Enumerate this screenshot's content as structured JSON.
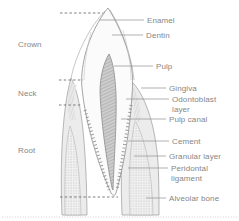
{
  "diagram": {
    "region_labels": {
      "crown": "Crown",
      "neck": "Neck",
      "root": "Root"
    },
    "part_labels": {
      "enamel": "Enamel",
      "dentin": "Dentin",
      "pulp": "Pulp",
      "gingiva": "Gingiva",
      "odontoblast_layer": "Odontoblast layer",
      "pulp_canal": "Pulp canal",
      "cement": "Cement",
      "granular_layer": "Granular layer",
      "peridontal_ligament": "Peridontal ligament",
      "alveolar_bone": "Alveolar bone"
    },
    "colors": {
      "background": "#ffffff",
      "label_text": "#868686",
      "leader_line": "#8f8f8f",
      "outline": "#8f8f8f",
      "tooth_fill": "#fbfbfb",
      "gum_fill": "#ececec",
      "pulp_fill": "#cccccc"
    }
  }
}
